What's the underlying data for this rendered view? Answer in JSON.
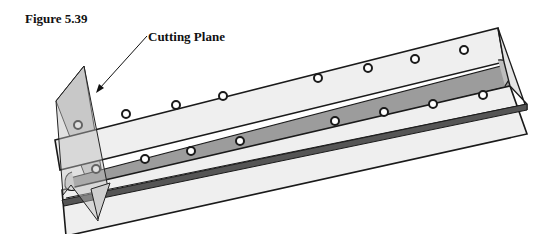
{
  "figure": {
    "title": "Figure 5.39",
    "callout_label": "Cutting Plane"
  },
  "colors": {
    "background": "#ffffff",
    "beam_face": "#ececec",
    "rail": "#9a9a9a",
    "plane": "#c8c8c8",
    "outline": "#1a1a1a"
  }
}
